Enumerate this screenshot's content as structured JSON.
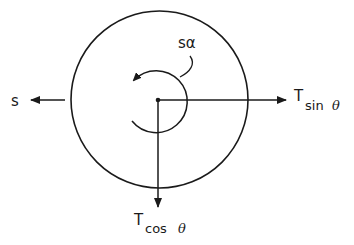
{
  "diagram": {
    "body": {
      "shape": "circle",
      "center": [
        159,
        100
      ],
      "radius": 89
    },
    "center_point": {
      "position": [
        158,
        100
      ]
    },
    "forces": [
      {
        "id": "s",
        "label": "s",
        "direction": "left"
      },
      {
        "id": "t_sin",
        "label_main": "T",
        "label_sub": "sin",
        "label_angle": "θ",
        "direction": "right"
      },
      {
        "id": "t_cos",
        "label_main": "T",
        "label_sub": "cos",
        "label_angle": "θ",
        "direction": "down"
      }
    ],
    "moment": {
      "label": "sα",
      "direction": "counterclockwise"
    },
    "colors": {
      "ink": "#1a1a1a",
      "background": "#ffffff"
    }
  }
}
